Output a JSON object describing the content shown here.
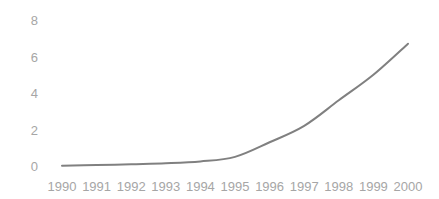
{
  "chart_data": {
    "type": "line",
    "title": "",
    "subtitle": "",
    "xlabel": "",
    "ylabel": "",
    "categories": [
      "1990",
      "1991",
      "1992",
      "1993",
      "1994",
      "1995",
      "1996",
      "1997",
      "1998",
      "1999",
      "2000"
    ],
    "x": [
      1990,
      1991,
      1992,
      1993,
      1994,
      1995,
      1996,
      1997,
      1998,
      1999,
      2000
    ],
    "values": [
      0.02,
      0.05,
      0.1,
      0.15,
      0.25,
      0.5,
      1.3,
      2.2,
      3.6,
      5.0,
      6.7
    ],
    "series": [
      {
        "name": "",
        "values": [
          0.02,
          0.05,
          0.1,
          0.15,
          0.25,
          0.5,
          1.3,
          2.2,
          3.6,
          5.0,
          6.7
        ],
        "color": "#808080"
      }
    ],
    "y_ticks": [
      0,
      2,
      4,
      6,
      8
    ],
    "y_tick_labels": [
      "0",
      "2",
      "4",
      "6",
      "8"
    ],
    "x_tick_labels": [
      "1990",
      "1991",
      "1992",
      "1993",
      "1994",
      "1995",
      "1996",
      "1997",
      "1998",
      "1999",
      "2000"
    ],
    "ylim": [
      0,
      8
    ],
    "xlim": [
      1990,
      2000
    ],
    "grid": false,
    "legend": false,
    "legend_position": "none",
    "markers": false,
    "annotations": [],
    "colors": {
      "line": "#808080",
      "tick_label": "#a6a6a6",
      "background": "#ffffff"
    }
  }
}
